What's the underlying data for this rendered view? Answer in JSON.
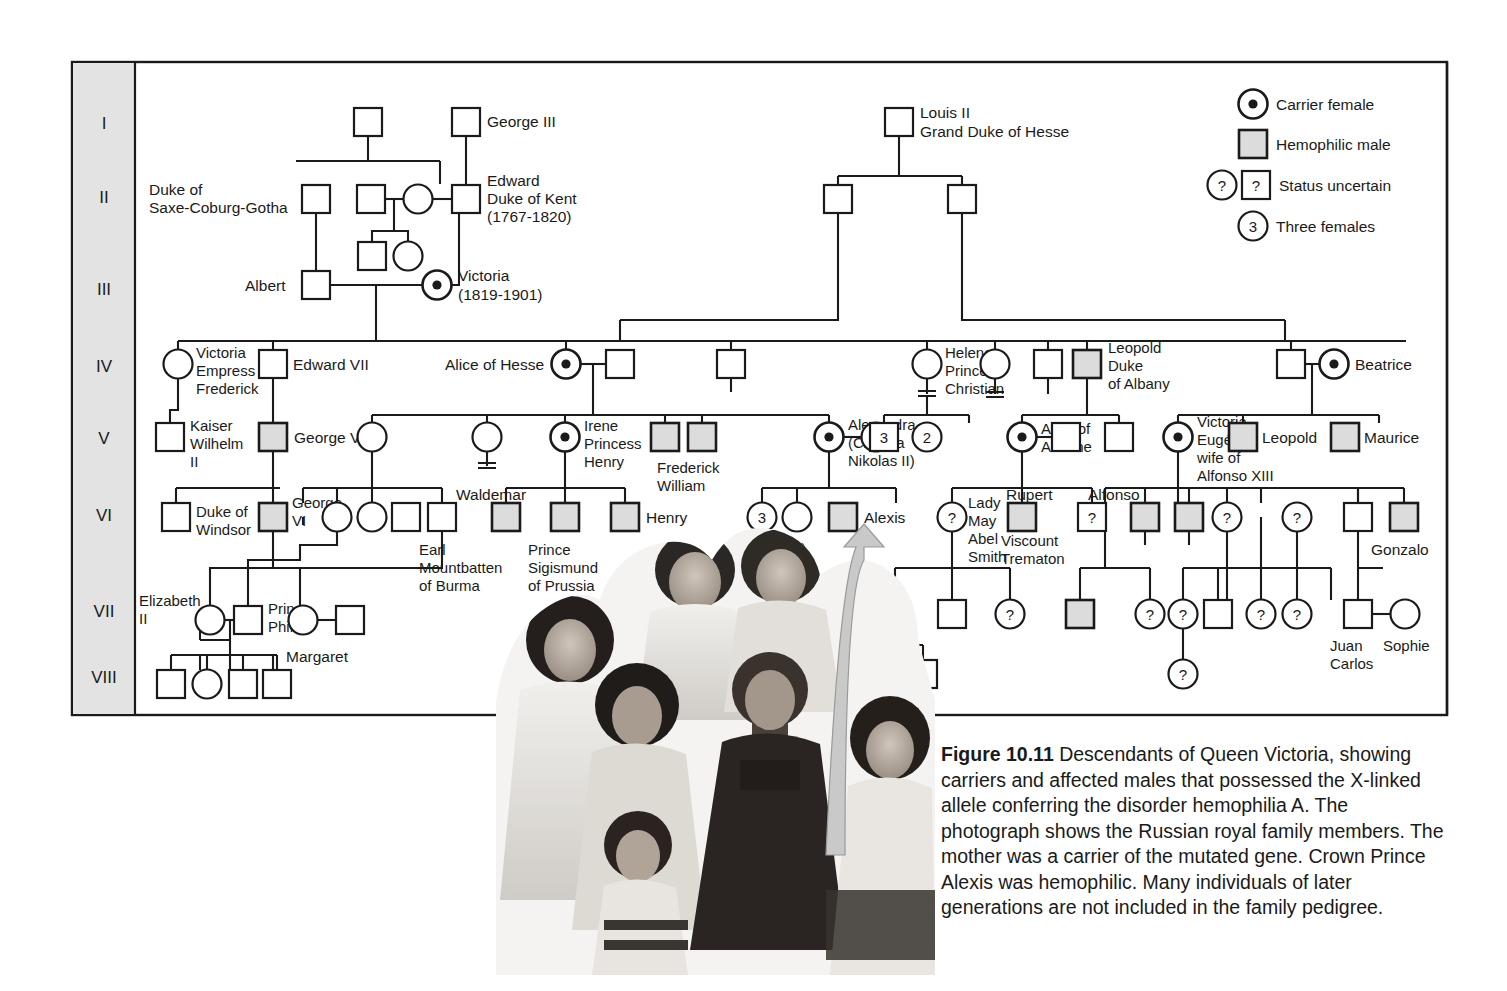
{
  "figure": {
    "number": "Figure 10.11",
    "caption": "Descendants of Queen Victoria, showing carriers and affected males that possessed the X-linked allele conferring the disorder hemophilia A. The photograph shows the Russian royal family members. The mother was a carrier of the mutated gene. Crown Prince Alexis was hemophilic. Many individuals of later generations are not included in the family pedigree."
  },
  "colors": {
    "line": "#1a1a1a",
    "affected_fill": "#dcdcdc",
    "gen_column_bg": "#e3e3e3",
    "arrow_fill": "#c9c9c9",
    "photo_tint": "#585858"
  },
  "generations": {
    "label": "Generation",
    "items": [
      "I",
      "II",
      "III",
      "IV",
      "V",
      "VI",
      "VII",
      "VIII"
    ]
  },
  "legend": {
    "items": [
      {
        "symbol": "carrier-female-circle",
        "label": "Carrier female"
      },
      {
        "symbol": "hemophilic-male-square",
        "label": "Hemophilic male"
      },
      {
        "symbol": "uncertain-circle-and-square",
        "label": "Status uncertain"
      },
      {
        "symbol": "three-females-circle",
        "label": "Three females"
      }
    ],
    "uncertain_glyph": "?",
    "three_glyph": "3"
  },
  "people": {
    "george_iii": "George III",
    "duke_saxe_coburg_gotha": "Duke of\nSaxe-Coburg-Gotha",
    "edward_duke_of_kent": "Edward\nDuke of Kent\n(1767-1820)",
    "albert": "Albert",
    "victoria": "Victoria\n(1819-1901)",
    "louis_ii": "Louis II\nGrand Duke of Hesse",
    "victoria_empress_frederick": "Victoria\nEmpress\nFrederick",
    "edward_vii": "Edward VII",
    "alice_of_hesse": "Alice of Hesse",
    "helena_princess_christian": "Helena\nPrincess\nChristian",
    "leopold_duke_of_albany": "Leopold\nDuke\nof Albany",
    "beatrice": "Beatrice",
    "kaiser_wilhelm_ii": "Kaiser\nWilhelm\nII",
    "george_v": "George V",
    "irene_princess_henry": "Irene\nPrincess\nHenry",
    "frederick_william": "Frederick\nWilliam",
    "alexandra": "Alexandra\n(Czarina\nNikolas II)",
    "alice_of_athlone": "Alice of\nAthlone",
    "victoria_eugenie": "Victoria\nEugénie,\nwife of\nAlfonso XIII",
    "leopold": "Leopold",
    "maurice": "Maurice",
    "duke_of_windsor": "Duke of\nWindsor",
    "george_vi": "George\nVI",
    "waldemar": "Waldemar",
    "earl_mountbatten": "Earl\nMountbatten\nof Burma",
    "prince_sigismund": "Prince\nSigismund\nof Prussia",
    "henry": "Henry",
    "anastasia": "Anastasia",
    "alexis": "Alexis",
    "lady_may_abel_smith": "Lady\nMay\nAbel\nSmith",
    "rupert": "Rupert",
    "viscount_trematon": "Viscount\nTrematon",
    "alfonso": "Alfonso",
    "gonzalo": "Gonzalo",
    "elizabeth_ii": "Elizabeth\nII",
    "prince_phillip": "Prince\nPhillip",
    "margaret": "Margaret",
    "juan_carlos": "Juan\nCarlos",
    "sophie": "Sophie"
  },
  "counts": {
    "three": "3",
    "two": "2",
    "uncertain": "?"
  }
}
